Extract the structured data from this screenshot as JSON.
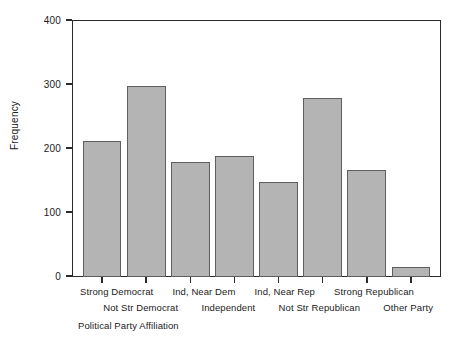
{
  "chart_data": {
    "type": "bar",
    "title": "",
    "xlabel": "Political Party Affiliation",
    "ylabel": "Frequency",
    "categories": [
      "Strong Democrat",
      "Not Str Democrat",
      "Ind, Near Dem",
      "Independent",
      "Ind, Near Rep",
      "Not Str Republican",
      "Strong Republican",
      "Other Party"
    ],
    "values": [
      212,
      297,
      179,
      188,
      148,
      278,
      167,
      15
    ],
    "ylim": [
      0,
      400
    ],
    "yticks": [
      0,
      100,
      200,
      300,
      400
    ],
    "ytick_labels": [
      "0",
      "100",
      "200",
      "300",
      "400"
    ],
    "grid": false,
    "legend": false,
    "bar_color": "#b4b4b4",
    "bar_edge_color": "#5e5e5e",
    "axis_color": "#2b2b2b",
    "background": "#ffffff",
    "label_stagger": [
      "top",
      "bottom",
      "top",
      "bottom",
      "top",
      "bottom",
      "top",
      "bottom"
    ]
  }
}
